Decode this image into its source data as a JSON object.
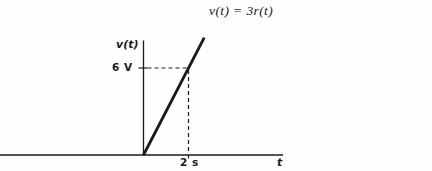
{
  "figure": {
    "equation": "v(t) = 3r(t)"
  },
  "graph": {
    "ylabel": "v(t)",
    "xlabel": "t",
    "y_tick_label": "6 V",
    "x_tick_label": "2 s"
  },
  "chart_data": {
    "type": "line",
    "title": "v(t) = 3r(t)",
    "xlabel": "t",
    "ylabel": "v(t)",
    "points": [
      [
        0,
        0
      ],
      [
        2.7,
        8.1
      ]
    ],
    "marked_point": {
      "t": 2,
      "v": 6,
      "t_label": "2 s",
      "v_label": "6 V"
    },
    "xlim": [
      -6.4,
      6.2
    ],
    "ylim": [
      0,
      7.9
    ],
    "grid": false,
    "legend": false,
    "annotations": [
      "dashed horizontal guide from y-axis at 6 V to the ramp line",
      "dashed vertical guide from the ramp line down to the t-axis at 2 s"
    ],
    "line_color": "#1a1a1a",
    "background": "#fefefe"
  }
}
